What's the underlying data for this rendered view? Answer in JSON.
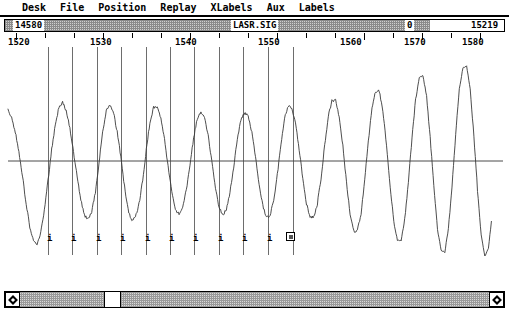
{
  "window": {
    "title": "LASR.SIG",
    "left_value": "14580",
    "mid_value": "0",
    "right_value": "15219"
  },
  "menubar": {
    "items": [
      {
        "label": "Desk"
      },
      {
        "label": "File"
      },
      {
        "label": "Position"
      },
      {
        "label": "Replay"
      },
      {
        "label": "XLabels"
      },
      {
        "label": "Aux"
      },
      {
        "label": "Labels"
      }
    ]
  },
  "ruler": {
    "labels": [
      "1520",
      "1530",
      "1540",
      "1550",
      "1560",
      "1570",
      "1580"
    ],
    "label_x": [
      8,
      90,
      175,
      258,
      340,
      404,
      462
    ],
    "tick_x": [
      16,
      45,
      74,
      103,
      132,
      161,
      190,
      219,
      248,
      277,
      306,
      335,
      364,
      393,
      422,
      451,
      480
    ],
    "major_tick_x": [
      16,
      103,
      190,
      277,
      364,
      422,
      480
    ]
  },
  "markers": {
    "label": "i",
    "line_x": [
      48,
      72,
      97,
      121,
      146,
      170,
      194,
      219,
      243,
      268,
      293
    ],
    "selected_index": 10,
    "selected_label": "0"
  },
  "scrollbar": {
    "left_arrow": "scroll-left",
    "right_arrow": "scroll-right",
    "thumb_left_pct": 18.0,
    "thumb_width_pct": 3.2
  },
  "chart_data": {
    "type": "line",
    "title": "LASR.SIG",
    "xlabel": "",
    "ylabel": "",
    "xlim": [
      1516.5,
      1584.5
    ],
    "ylim": [
      -1.05,
      1.05
    ],
    "grid": false,
    "legend": null,
    "zero_line": 0,
    "x": [
      1516.5,
      1517.0,
      1517.5,
      1518.0,
      1518.5,
      1519.0,
      1519.5,
      1520.0,
      1520.5,
      1521.0,
      1521.5,
      1522.0,
      1522.5,
      1523.0,
      1523.5,
      1524.0,
      1524.5,
      1525.0,
      1525.5,
      1526.0,
      1526.5,
      1527.0,
      1527.5,
      1528.0,
      1528.5,
      1529.0,
      1529.5,
      1530.0,
      1530.5,
      1531.0,
      1531.5,
      1532.0,
      1532.5,
      1533.0,
      1533.5,
      1534.0,
      1534.5,
      1535.0,
      1535.5,
      1536.0,
      1536.5,
      1537.0,
      1537.5,
      1538.0,
      1538.5,
      1539.0,
      1539.5,
      1540.0,
      1540.5,
      1541.0,
      1541.5,
      1542.0,
      1542.5,
      1543.0,
      1543.5,
      1544.0,
      1544.5,
      1545.0,
      1545.5,
      1546.0,
      1546.5,
      1547.0,
      1547.5,
      1548.0,
      1548.5,
      1549.0,
      1549.5,
      1550.0,
      1550.5,
      1551.0,
      1551.5,
      1552.0,
      1552.5,
      1553.0,
      1553.5,
      1554.0,
      1554.5,
      1555.0,
      1555.5,
      1556.0,
      1556.5,
      1557.0,
      1557.5,
      1558.0,
      1558.5,
      1559.0,
      1559.5,
      1560.0,
      1560.5,
      1561.0,
      1561.5,
      1562.0,
      1562.5,
      1563.0,
      1563.5,
      1564.0,
      1564.5,
      1565.0,
      1565.5,
      1566.0,
      1566.5,
      1567.0,
      1567.5,
      1568.0,
      1568.5,
      1569.0,
      1569.5,
      1570.0,
      1570.5,
      1571.0,
      1571.5,
      1572.0,
      1572.5,
      1573.0,
      1573.5,
      1574.0,
      1574.5,
      1575.0,
      1575.5,
      1576.0,
      1576.5,
      1577.0,
      1577.5,
      1578.0,
      1578.5,
      1579.0,
      1579.5,
      1580.0,
      1580.5,
      1581.0,
      1581.5,
      1582.0,
      1582.5,
      1583.0,
      1583.5,
      1584.0,
      1584.5
    ],
    "y": [
      0.52,
      0.44,
      0.3,
      0.1,
      -0.16,
      -0.45,
      -0.68,
      -0.82,
      -0.86,
      -0.74,
      -0.5,
      -0.2,
      0.12,
      0.38,
      0.55,
      0.6,
      0.52,
      0.34,
      0.1,
      -0.16,
      -0.4,
      -0.56,
      -0.6,
      -0.52,
      -0.32,
      -0.02,
      0.3,
      0.52,
      0.58,
      0.5,
      0.3,
      0.04,
      -0.26,
      -0.5,
      -0.62,
      -0.58,
      -0.44,
      -0.2,
      0.12,
      0.4,
      0.55,
      0.56,
      0.44,
      0.22,
      -0.06,
      -0.32,
      -0.5,
      -0.55,
      -0.48,
      -0.3,
      -0.04,
      0.24,
      0.44,
      0.5,
      0.44,
      0.26,
      0.0,
      -0.28,
      -0.48,
      -0.56,
      -0.5,
      -0.32,
      -0.06,
      0.22,
      0.42,
      0.5,
      0.46,
      0.3,
      0.04,
      -0.24,
      -0.46,
      -0.58,
      -0.56,
      -0.4,
      -0.14,
      0.18,
      0.44,
      0.56,
      0.54,
      0.38,
      0.12,
      -0.18,
      -0.44,
      -0.58,
      -0.58,
      -0.44,
      -0.18,
      0.16,
      0.46,
      0.62,
      0.62,
      0.46,
      0.16,
      -0.22,
      -0.54,
      -0.72,
      -0.72,
      -0.54,
      -0.2,
      0.2,
      0.54,
      0.72,
      0.72,
      0.52,
      0.16,
      -0.26,
      -0.62,
      -0.82,
      -0.82,
      -0.6,
      -0.22,
      0.24,
      0.64,
      0.86,
      0.88,
      0.66,
      0.24,
      -0.26,
      -0.7,
      -0.92,
      -0.94,
      -0.7,
      -0.26,
      0.28,
      0.74,
      0.96,
      0.98,
      0.74,
      0.26,
      -0.3,
      -0.76,
      -0.98,
      -0.9,
      -0.55
    ]
  }
}
